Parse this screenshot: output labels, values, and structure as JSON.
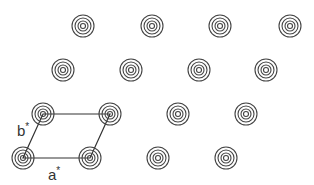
{
  "diagram": {
    "ring_color": "#444444",
    "line_color": "#333333",
    "spot_rings": [
      11,
      8,
      5,
      2.5
    ],
    "spots": [
      {
        "x": 83,
        "y": 26
      },
      {
        "x": 152,
        "y": 26
      },
      {
        "x": 220,
        "y": 26
      },
      {
        "x": 290,
        "y": 26
      },
      {
        "x": 63,
        "y": 70
      },
      {
        "x": 131,
        "y": 70
      },
      {
        "x": 199,
        "y": 70
      },
      {
        "x": 266,
        "y": 70
      },
      {
        "x": 43,
        "y": 114
      },
      {
        "x": 110,
        "y": 114
      },
      {
        "x": 178,
        "y": 114
      },
      {
        "x": 246,
        "y": 114
      },
      {
        "x": 23,
        "y": 158
      },
      {
        "x": 90,
        "y": 158
      },
      {
        "x": 158,
        "y": 158
      },
      {
        "x": 226,
        "y": 158
      }
    ],
    "unit_cell": [
      [
        23,
        158
      ],
      [
        90,
        158
      ],
      [
        110,
        114
      ],
      [
        43,
        114
      ]
    ],
    "labels": {
      "a_star": {
        "text": "a",
        "sup": "*",
        "x": 48,
        "y": 167
      },
      "b_star": {
        "text": "b",
        "sup": "*",
        "x": 17,
        "y": 123
      }
    }
  }
}
